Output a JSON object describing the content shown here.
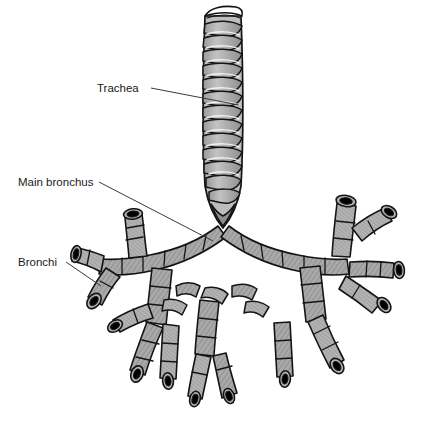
{
  "figure": {
    "name": "trachea-and-bronchial-tree",
    "background_color": "#ffffff",
    "ink_color": "#141414",
    "cartilage_fill": "#a9a9a9",
    "cartilage_fill_light": "#bdbdbd",
    "cartilage_fill_dark": "#8d8d8d",
    "lumen_color": "#101010",
    "highlight_color": "#f2f2f2",
    "leader_color": "#3a3a3a",
    "width": 447,
    "height": 423
  },
  "annotations": [
    {
      "id": "trachea",
      "label": "Trachea",
      "text_x": 97,
      "text_y": 92,
      "anchor": "start",
      "leader": {
        "x1": 151,
        "y1": 88,
        "x2": 239,
        "y2": 105
      }
    },
    {
      "id": "main-bronchus",
      "label": "Main bronchus",
      "text_x": 18,
      "text_y": 186,
      "anchor": "start",
      "leader": {
        "x1": 99,
        "y1": 182,
        "x2": 213,
        "y2": 241
      }
    },
    {
      "id": "bronchi",
      "label": "Bronchi",
      "text_x": 18,
      "text_y": 266,
      "anchor": "start",
      "leader": {
        "x1": 66,
        "y1": 262,
        "x2": 101,
        "y2": 286
      }
    }
  ],
  "structures": {
    "trachea_label": "Trachea",
    "carina_label": "Carina (bifurcation)",
    "left_main_bronchus_label": "Left main bronchus",
    "right_main_bronchus_label": "Right main bronchus",
    "lobar_bronchi_label": "Lobar bronchi",
    "segmental_bronchi_label": "Segmental bronchi",
    "cut_end_label": "Cut end with open lumen"
  }
}
